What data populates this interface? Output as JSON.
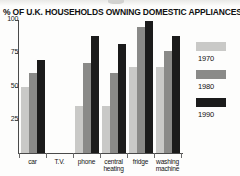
{
  "chart_data": {
    "type": "bar",
    "title": "% OF U.K. HOUSEHOLDS OWNING DOMESTIC APPLIANCES",
    "xlabel": "",
    "ylabel": "",
    "ylim": [
      0,
      100
    ],
    "yticks": [
      100,
      75,
      50,
      25
    ],
    "grid": false,
    "legend_position": "right",
    "categories": [
      "car",
      "T.V.",
      "phone",
      "central heating",
      "fridge",
      "washing machine"
    ],
    "series": [
      {
        "name": "1970",
        "color": "#c9c9c7",
        "values": [
          50,
          91,
          35,
          35,
          65,
          65
        ]
      },
      {
        "name": "1980",
        "color": "#8a8a88",
        "values": [
          60,
          97,
          68,
          60,
          95,
          77
        ]
      },
      {
        "name": "1990",
        "color": "#1b1b1b",
        "values": [
          70,
          98,
          88,
          82,
          99,
          88
        ]
      }
    ]
  },
  "axis": {
    "tick_100": "100",
    "tick_75": "75",
    "tick_50": "50",
    "tick_25": "25"
  },
  "xlabels": {
    "c0": "car",
    "c1": "T.V.",
    "c2": "phone",
    "c3_line1": "central",
    "c3_line2": "heating",
    "c4": "fridge",
    "c5_line1": "washing",
    "c5_line2": "machine"
  },
  "legend": {
    "l0": "1970",
    "l1": "1980",
    "l2": "1990"
  }
}
